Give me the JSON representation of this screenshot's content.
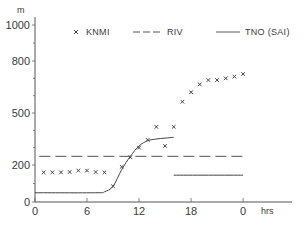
{
  "chart_data": {
    "type": "line",
    "title": "",
    "xlabel": "hrs",
    "ylabel": "m",
    "x_ticks": [
      "0",
      "6",
      "12",
      "18",
      "0"
    ],
    "x_tick_hours": [
      0,
      6,
      12,
      18,
      24
    ],
    "y_ticks": [
      "0",
      "200",
      "500",
      "800",
      "1000"
    ],
    "y_tick_values": [
      0,
      200,
      500,
      800,
      1000
    ],
    "xlim": [
      0,
      30
    ],
    "ylim": [
      0,
      1000
    ],
    "grid": false,
    "legend_position": "top",
    "legend": [
      {
        "label": "KNMI",
        "style": "x-marker"
      },
      {
        "label": "RIV",
        "style": "dashed"
      },
      {
        "label": "TNO (SAI)",
        "style": "solid"
      }
    ],
    "series": [
      {
        "name": "KNMI",
        "style": "x-marker",
        "x": [
          1,
          2,
          3,
          4,
          5,
          6,
          7,
          8,
          9,
          10,
          11,
          12,
          13,
          14,
          15,
          16,
          17,
          18,
          19,
          20,
          21,
          22,
          23,
          24
        ],
        "values": [
          160,
          160,
          160,
          162,
          170,
          170,
          162,
          160,
          85,
          190,
          245,
          300,
          345,
          420,
          310,
          420,
          565,
          620,
          665,
          690,
          690,
          700,
          710,
          725
        ]
      },
      {
        "name": "RIV",
        "style": "dashed",
        "x": [
          0.5,
          24
        ],
        "values": [
          250,
          250
        ]
      },
      {
        "name": "TNO (SAI)",
        "style": "solid",
        "segments": [
          {
            "x": [
              0,
              7,
              8,
              9,
              10,
              11,
              12,
              13,
              14,
              15,
              16
            ],
            "values": [
              50,
              50,
              55,
              85,
              175,
              250,
              310,
              340,
              350,
              355,
              360
            ]
          },
          {
            "x": [
              16,
              24
            ],
            "values": [
              145,
              145
            ]
          }
        ]
      }
    ]
  }
}
